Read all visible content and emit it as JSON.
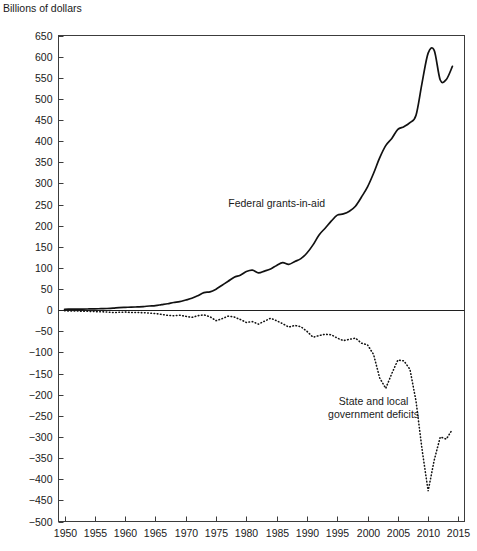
{
  "chart_data": {
    "type": "line",
    "title": "",
    "subtitle": "",
    "unit_label": "Billions of dollars",
    "xlabel": "",
    "ylabel": "Billions of dollars",
    "grid": false,
    "legend_position": "inline-annotation",
    "xlim": [
      1949,
      2016
    ],
    "ylim": [
      -500,
      650
    ],
    "xticks": [
      1950,
      1955,
      1960,
      1965,
      1970,
      1975,
      1980,
      1985,
      1990,
      1995,
      2000,
      2005,
      2010,
      2015
    ],
    "xtick_labels": [
      "1950",
      "1955",
      "1960",
      "1965",
      "1970",
      "1975",
      "1980",
      "1985",
      "1990",
      "1995",
      "2000",
      "2005",
      "2010",
      "2015"
    ],
    "yticks": [
      -500,
      -450,
      -400,
      -350,
      -300,
      -250,
      -200,
      -150,
      -100,
      -50,
      0,
      50,
      100,
      150,
      200,
      250,
      300,
      350,
      400,
      450,
      500,
      550,
      600,
      650
    ],
    "ytick_labels": [
      "−500",
      "−450",
      "−400",
      "−350",
      "−300",
      "−250",
      "−200",
      "−150",
      "−100",
      "−50",
      "0",
      "50",
      "100",
      "150",
      "200",
      "250",
      "300",
      "350",
      "400",
      "450",
      "500",
      "550",
      "600",
      "650"
    ],
    "annotations": [
      {
        "name": "federal-grants-label",
        "text": "Federal grants-in-aid",
        "x": 1993,
        "y": 245
      },
      {
        "name": "state-local-deficits-label",
        "text_line1": "State and local",
        "text_line2": "government deficits",
        "x": 2001,
        "y": -225
      }
    ],
    "series": [
      {
        "name": "Federal grants-in-aid",
        "style": "solid",
        "x": [
          1950,
          1951,
          1952,
          1953,
          1954,
          1955,
          1956,
          1957,
          1958,
          1959,
          1960,
          1961,
          1962,
          1963,
          1964,
          1965,
          1966,
          1967,
          1968,
          1969,
          1970,
          1971,
          1972,
          1973,
          1974,
          1975,
          1976,
          1977,
          1978,
          1979,
          1980,
          1981,
          1982,
          1983,
          1984,
          1985,
          1986,
          1987,
          1988,
          1989,
          1990,
          1991,
          1992,
          1993,
          1994,
          1995,
          1996,
          1997,
          1998,
          1999,
          2000,
          2001,
          2002,
          2003,
          2004,
          2005,
          2006,
          2007,
          2008,
          2009,
          2010,
          2011,
          2012,
          2013,
          2014
        ],
        "values": [
          2.2,
          2.4,
          2.5,
          2.7,
          2.9,
          3.1,
          3.6,
          4.0,
          4.8,
          6.2,
          6.8,
          7.1,
          7.8,
          8.6,
          9.9,
          10.8,
          13.0,
          15.2,
          18.2,
          20.1,
          24.0,
          28.1,
          34.4,
          41.7,
          43.3,
          49.8,
          59.1,
          68.4,
          77.9,
          82.9,
          91.4,
          94.8,
          88.2,
          92.5,
          97.6,
          105.9,
          112.4,
          108.4,
          115.3,
          122.0,
          135.3,
          154.5,
          178.1,
          194.0,
          210.6,
          225.0,
          227.8,
          234.2,
          246.1,
          267.8,
          291.9,
          324.1,
          360.5,
          389.5,
          406.4,
          428.0,
          434.1,
          443.8,
          461.3,
          538.0,
          608.4,
          615.0,
          544.6,
          546.0,
          577.0
        ]
      },
      {
        "name": "State and local government deficits",
        "style": "dotted",
        "x": [
          1950,
          1951,
          1952,
          1953,
          1954,
          1955,
          1956,
          1957,
          1958,
          1959,
          1960,
          1961,
          1962,
          1963,
          1964,
          1965,
          1966,
          1967,
          1968,
          1969,
          1970,
          1971,
          1972,
          1973,
          1974,
          1975,
          1976,
          1977,
          1978,
          1979,
          1980,
          1981,
          1982,
          1983,
          1984,
          1985,
          1986,
          1987,
          1988,
          1989,
          1990,
          1991,
          1992,
          1993,
          1994,
          1995,
          1996,
          1997,
          1998,
          1999,
          2000,
          2001,
          2002,
          2003,
          2004,
          2005,
          2006,
          2007,
          2008,
          2009,
          2010,
          2011,
          2012,
          2013,
          2014
        ],
        "values": [
          -1.5,
          -1.8,
          -2.0,
          -2.3,
          -2.8,
          -3.2,
          -3.7,
          -4.3,
          -5.5,
          -5.0,
          -4.4,
          -5.6,
          -5.4,
          -6.0,
          -6.8,
          -7.9,
          -10.0,
          -12.2,
          -13.0,
          -12.0,
          -14.5,
          -17.0,
          -13.0,
          -11.0,
          -15.5,
          -25.0,
          -20.0,
          -14.0,
          -16.0,
          -22.0,
          -29.0,
          -27.0,
          -33.0,
          -26.0,
          -19.0,
          -25.0,
          -32.0,
          -40.0,
          -36.0,
          -39.0,
          -50.0,
          -64.0,
          -60.0,
          -57.0,
          -58.0,
          -66.0,
          -72.0,
          -69.0,
          -66.0,
          -78.0,
          -82.0,
          -105.0,
          -160.0,
          -185.0,
          -150.0,
          -118.0,
          -120.0,
          -140.0,
          -215.0,
          -330.0,
          -428.0,
          -355.0,
          -300.0,
          -305.0,
          -282.0
        ]
      }
    ]
  }
}
